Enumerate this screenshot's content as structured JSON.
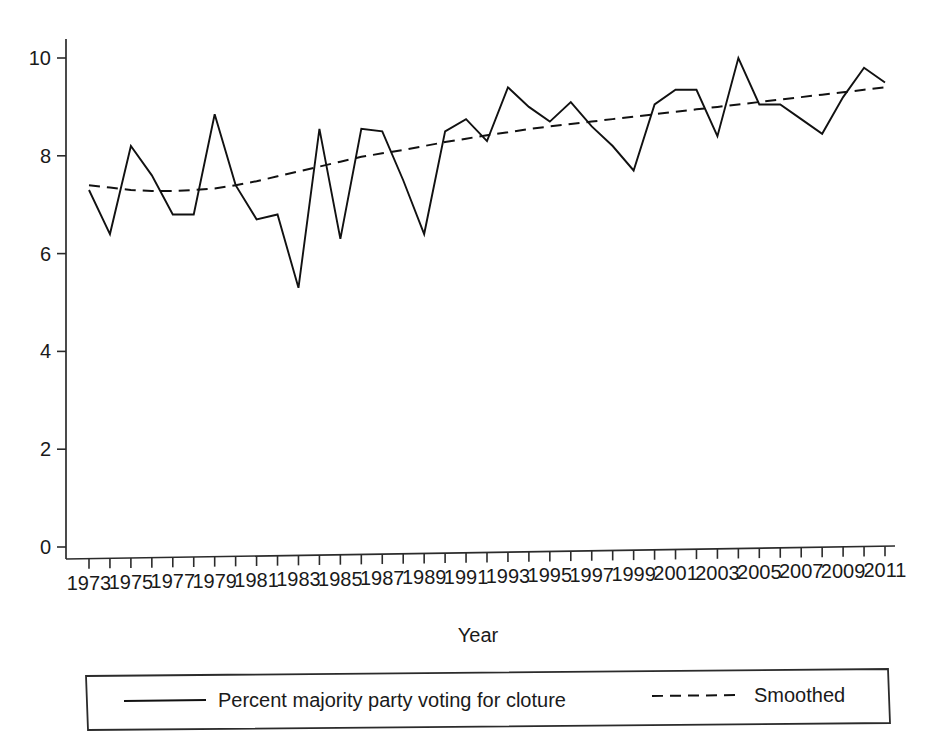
{
  "chart_data": {
    "type": "line",
    "title": "",
    "xlabel": "Year",
    "ylabel": "",
    "xlim": [
      1973,
      2011
    ],
    "ylim": [
      0,
      10
    ],
    "grid": false,
    "legend_position": "bottom",
    "y_ticks": [
      0,
      2,
      4,
      6,
      8,
      10
    ],
    "y_tick_labels": [
      "0",
      "2",
      "4",
      "6",
      "8",
      "10"
    ],
    "x": [
      1973,
      1974,
      1975,
      1976,
      1977,
      1978,
      1979,
      1980,
      1981,
      1982,
      1983,
      1984,
      1985,
      1986,
      1987,
      1988,
      1989,
      1990,
      1991,
      1992,
      1993,
      1994,
      1995,
      1996,
      1997,
      1998,
      1999,
      2000,
      2001,
      2002,
      2003,
      2004,
      2005,
      2006,
      2007,
      2008,
      2009,
      2010,
      2011
    ],
    "x_tick_labels": [
      "1973",
      "1974",
      "1975",
      "1976",
      "1977",
      "1978",
      "1979",
      "1980",
      "1981",
      "1982",
      "1983",
      "1984",
      "1985",
      "1986",
      "1987",
      "1988",
      "1989",
      "1990",
      "1991",
      "1992",
      "1993",
      "1994",
      "1995",
      "1996",
      "1997",
      "1998",
      "1999",
      "2000",
      "2001",
      "2002",
      "2003",
      "2004",
      "2005",
      "2006",
      "2007",
      "2008",
      "2009",
      "2010",
      "2011"
    ],
    "x_labels_shown": [
      "1973",
      "1975",
      "1977",
      "1979",
      "1981",
      "1983",
      "1985",
      "1987",
      "1989",
      "1991",
      "1993",
      "1995",
      "1997",
      "1999",
      "2001",
      "2003",
      "2005",
      "2007",
      "2009",
      "2011"
    ],
    "series": [
      {
        "name": "Percent majority party voting for cloture",
        "style": "solid",
        "values": [
          7.3,
          6.4,
          8.2,
          7.6,
          6.8,
          6.8,
          8.85,
          7.4,
          6.7,
          6.8,
          5.3,
          8.55,
          6.3,
          8.55,
          8.5,
          7.5,
          6.4,
          8.5,
          8.75,
          8.3,
          9.4,
          9.0,
          8.7,
          9.1,
          8.6,
          8.2,
          7.7,
          9.05,
          9.35,
          9.35,
          8.4,
          10.0,
          9.05,
          9.05,
          8.75,
          8.45,
          9.2,
          9.8,
          9.5
        ]
      },
      {
        "name": "Smoothed",
        "style": "dashed",
        "values": [
          7.4,
          7.35,
          7.3,
          7.28,
          7.28,
          7.3,
          7.33,
          7.4,
          7.48,
          7.58,
          7.68,
          7.78,
          7.88,
          7.98,
          8.05,
          8.12,
          8.2,
          8.28,
          8.35,
          8.42,
          8.48,
          8.55,
          8.6,
          8.65,
          8.7,
          8.75,
          8.8,
          8.85,
          8.9,
          8.95,
          9.0,
          9.05,
          9.1,
          9.15,
          9.2,
          9.25,
          9.3,
          9.35,
          9.4
        ]
      }
    ],
    "legend": [
      {
        "label": "Percent majority party voting for cloture",
        "style": "solid"
      },
      {
        "label": "Smoothed",
        "style": "dashed"
      }
    ]
  }
}
